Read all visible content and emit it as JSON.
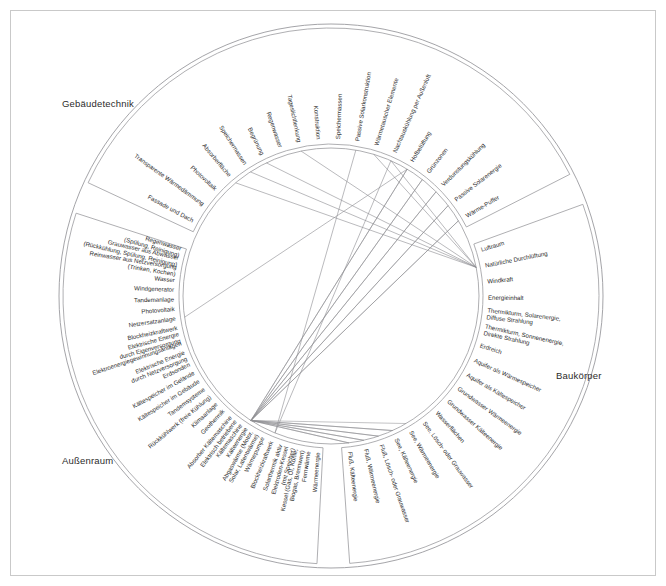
{
  "figure": {
    "title": "",
    "sections": [
      {
        "id": "gebaeudetechnik",
        "label": "Gebäudetechnik"
      },
      {
        "id": "baukoerper",
        "label": "Baukörper"
      },
      {
        "id": "aussenraum",
        "label": "Außenraum"
      }
    ],
    "colors": {
      "line": "#8f8f93",
      "arc": "#9a9a9e",
      "text": "#2b2b2b",
      "frame": "#c9c9c9",
      "background": "#ffffff"
    }
  },
  "chart_data": {
    "type": "chord",
    "xlabel": "",
    "ylabel": "",
    "grid": false,
    "legend_position": "none",
    "groups": [
      {
        "name": "Gebäudetechnik",
        "start_angle": 183,
        "end_angle": 288,
        "ring": "outer",
        "labels": [
          "Wärmeenergie",
          "Fernwärme",
          "Kessel (Gas, Öl, Kohle, Biogas, Brennwert)",
          "Elektroden-Kessel (mit Speicher)",
          "Solarthermik aktiv",
          "Blockheizkraftwerk",
          "Wärmepumpe",
          "Abgaswärme (Motor, Solar, Latentwärme)",
          "Kälteenergie",
          "Elektrisch betriebene Kältemaschine",
          "Absorber Kältemaschine",
          "Geothermik",
          "Klimaanlage",
          "Rückkühlwerk (freie Kühlung)",
          "Tandemsysteme",
          "Kältespeicher im Gebäude",
          "Kältespeicher im Gelände",
          "Erdsonden",
          "Elektrische Energie durch Netzversorgung",
          "Elektroenergiegewinnungsanlagen",
          "Elektrische Energie durch Eigenversorgung",
          "Blockheizkraftwerk",
          "Netzersatzanlage",
          "Photovoltaik",
          "Tandemanlage",
          "Windgenerator",
          "Wasser",
          "Reinwasser aus Netzversorgung (Trinken, Kochen)",
          "Grauwasser aus Abwasser (Rückkühlung, Spülung, Reinigung)",
          "Regenwasser (Spülung, Reinigung)"
        ]
      },
      {
        "name": "Baukörper",
        "start_angle": 295,
        "end_angle": 63,
        "ring": "outer",
        "labels": [
          "Fassade und Dach",
          "Transparente Wärmedämmung",
          "Photovoltaik",
          "Absorberfläche",
          "Speichermassen",
          "Begrünung",
          "Regenwasser",
          "Tageslichtlenkung",
          "Konstruktion",
          "Speichermassen",
          "Passive Solarkonstruktion",
          "Wärmetauscher Elemente",
          "Nachtauskühlung per Außenluft",
          "Hofbelüftung",
          "Grünzonen",
          "Verdunstungskühlung",
          "Passive Solarenergie",
          "Wärme-Puffer"
        ]
      },
      {
        "name": "Außenraum",
        "start_angle": 70,
        "end_angle": 176,
        "ring": "outer",
        "labels": [
          "Luftraum",
          "Natürliche Durchlüftung",
          "Windkraft",
          "Energieinhalt",
          "Thermikturm, Solarenergie, Diffuse Strahlung",
          "Thermikturm, Sonnenenergie, Direkte Strahlung",
          "Erdreich",
          "Aquifer als Wärmespeicher",
          "Aquifer als Kältespeicher",
          "Grundwasser Wärmeenergie",
          "Grundwasser Kälteenergie",
          "Wasserflächen",
          "See, Lösch- oder Grauwasser",
          "See, Wärmeenergie",
          "See, Kälteenergie",
          "Fluß, Lösch- oder Grauwasser",
          "Fluß, Wärmeenergie",
          "Fluß, Kälteenergie"
        ]
      }
    ],
    "hub_nodes": [
      {
        "name": "Kälteenergie-Hub",
        "group": "Gebäudetechnik",
        "angle": 270
      },
      {
        "name": "Natürliche Durchlüftung",
        "group": "Außenraum",
        "angle": 178
      },
      {
        "name": "Konstruktion",
        "group": "Baukörper",
        "angle": 330
      }
    ],
    "links": [
      {
        "from": "Kälteenergie",
        "to": "Fluß, Kälteenergie"
      },
      {
        "from": "Kälteenergie",
        "to": "Fluß, Wärmeenergie"
      },
      {
        "from": "Kälteenergie",
        "to": "Fluß, Lösch- oder Grauwasser"
      },
      {
        "from": "Kälteenergie",
        "to": "See, Kälteenergie"
      },
      {
        "from": "Kälteenergie",
        "to": "Wärme-Puffer"
      },
      {
        "from": "Kälteenergie",
        "to": "Passive Solarenergie"
      },
      {
        "from": "Kälteenergie",
        "to": "Verdunstungskühlung"
      },
      {
        "from": "Kälteenergie",
        "to": "Grünzonen"
      },
      {
        "from": "Kälteenergie",
        "to": "Hofbelüftung"
      },
      {
        "from": "Natürliche Durchlüftung",
        "to": "Absorberfläche"
      },
      {
        "from": "Natürliche Durchlüftung",
        "to": "Speichermassen"
      },
      {
        "from": "Natürliche Durchlüftung",
        "to": "Begrünung"
      },
      {
        "from": "Natürliche Durchlüftung",
        "to": "Tageslichtlenkung"
      },
      {
        "from": "Natürliche Durchlüftung",
        "to": "Nachtauskühlung per Außenluft"
      },
      {
        "from": "Natürliche Durchlüftung",
        "to": "Wärmetauscher Elemente"
      },
      {
        "from": "Blockheizkraftwerk",
        "to": "Nachtauskühlung per Außenluft"
      },
      {
        "from": "Blockheizkraftwerk",
        "to": "Passive Solarkonstruktion"
      },
      {
        "from": "Netzersatzanlage",
        "to": "Hofbelüftung"
      }
    ]
  }
}
